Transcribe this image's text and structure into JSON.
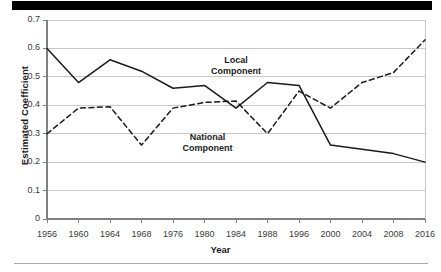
{
  "figure": {
    "top_bar": "black-header-bar",
    "bottom_rule": "footer-rule"
  },
  "axes": {
    "ylabel": "Estimated Coefficient",
    "xlabel": "Year",
    "yticks": [
      "0.7",
      "0.6",
      "0.5",
      "0.4",
      "0.3",
      "0.2",
      "0.1",
      "0"
    ],
    "xticks": [
      "1956",
      "1960",
      "1964",
      "1968",
      "1976",
      "1980",
      "1984",
      "1988",
      "1996",
      "2000",
      "2004",
      "2008",
      "2016"
    ]
  },
  "annotations": {
    "local_line1": "Local",
    "local_line2": "Component",
    "national_line1": "National",
    "national_line2": "Component"
  },
  "colors": {
    "line": "#1a1a1a",
    "grid": "#c8c8c8",
    "axis": "#808080",
    "text": "#1a1a1a",
    "header_bar": "#000000"
  },
  "chart_data": {
    "type": "line",
    "title": "",
    "xlabel": "Year",
    "ylabel": "Estimated Coefficient",
    "categories": [
      "1956",
      "1960",
      "1964",
      "1968",
      "1976",
      "1980",
      "1984",
      "1988",
      "1996",
      "2000",
      "2004",
      "2008",
      "2016"
    ],
    "ylim": [
      0,
      0.7
    ],
    "ytick_step": 0.1,
    "grid": "horizontal",
    "legend": "inline-annotations",
    "series": [
      {
        "name": "Local Component",
        "style": "solid",
        "values": [
          0.6,
          0.48,
          0.56,
          0.52,
          0.46,
          0.47,
          0.39,
          0.48,
          0.47,
          0.26,
          0.245,
          0.23,
          0.2
        ]
      },
      {
        "name": "National Component",
        "style": "dashed",
        "values": [
          0.3,
          0.39,
          0.395,
          0.26,
          0.39,
          0.41,
          0.415,
          0.3,
          0.45,
          0.39,
          0.48,
          0.515,
          0.63
        ]
      }
    ]
  }
}
